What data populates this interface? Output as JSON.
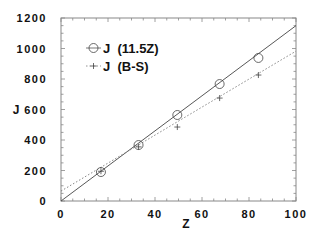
{
  "chart_data": {
    "type": "line",
    "title": "",
    "xlabel": "Z",
    "ylabel": "J",
    "xlim": [
      0,
      100
    ],
    "ylim": [
      0,
      1200
    ],
    "x_ticks": [
      0,
      20,
      40,
      60,
      80,
      100
    ],
    "y_ticks": [
      0,
      200,
      400,
      600,
      800,
      1000,
      1200
    ],
    "x_tick_labels": [
      "0",
      "2 0",
      "4 0",
      "6 0",
      "8 0",
      "1 0 0"
    ],
    "y_tick_labels": [
      "0",
      "2 0 0",
      "4 0 0",
      "6 0 0",
      "8 0 0",
      "1 0 0 0",
      "1 2 0 0"
    ],
    "grid": false,
    "legend_position": "upper left",
    "series": [
      {
        "name": "J  (11.5Z)",
        "marker": "circle",
        "line_style": "solid",
        "x": [
          17,
          33,
          49.5,
          67.5,
          84
        ],
        "y": [
          190,
          367,
          564,
          767,
          938
        ],
        "fit_line": {
          "x": [
            0,
            100
          ],
          "y": [
            0,
            1150
          ]
        }
      },
      {
        "name": "J  (B-S)",
        "marker": "plus",
        "line_style": "dotted",
        "x": [
          17,
          33,
          49.5,
          67.5,
          84
        ],
        "y": [
          195,
          355,
          485,
          675,
          826
        ],
        "fit_line": {
          "x": [
            0,
            100
          ],
          "y": [
            65,
            983
          ]
        }
      }
    ]
  },
  "legend": {
    "items": [
      {
        "label": "J  (11.5Z)"
      },
      {
        "label": "J  (B-S)"
      }
    ]
  },
  "axes": {
    "x_title": "Z",
    "y_title": "J"
  }
}
